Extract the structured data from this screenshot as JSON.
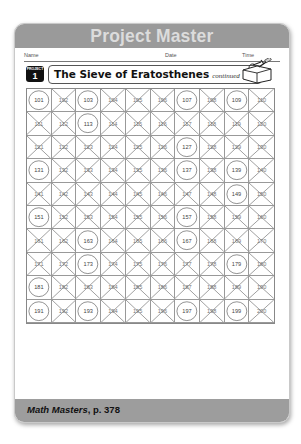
{
  "header": {
    "banner_title": "Project Master"
  },
  "meta_fields": {
    "name_label": "Name",
    "date_label": "Date",
    "time_label": "Time"
  },
  "project_badge": {
    "small_label": "PROJECT",
    "number": "1"
  },
  "title": {
    "main": "The Sieve of Eratosthenes",
    "sub": "continued"
  },
  "icons": {
    "header_icon": "toolbox-icon"
  },
  "grid": {
    "rows": 10,
    "columns": 10,
    "start": 101,
    "end": 200,
    "marking": {
      "prime": "circled",
      "composite": "crossed-out (X)"
    },
    "primes": [
      101,
      103,
      107,
      109,
      113,
      127,
      131,
      137,
      139,
      149,
      151,
      157,
      163,
      167,
      173,
      179,
      181,
      191,
      193,
      197,
      199
    ],
    "cells": [
      "101",
      "102",
      "103",
      "104",
      "105",
      "106",
      "107",
      "108",
      "109",
      "110",
      "111",
      "112",
      "113",
      "114",
      "115",
      "116",
      "117",
      "118",
      "119",
      "120",
      "121",
      "122",
      "123",
      "124",
      "125",
      "126",
      "127",
      "128",
      "129",
      "130",
      "131",
      "132",
      "133",
      "134",
      "135",
      "136",
      "137",
      "138",
      "139",
      "140",
      "141",
      "142",
      "143",
      "144",
      "145",
      "146",
      "147",
      "148",
      "149",
      "150",
      "151",
      "152",
      "153",
      "154",
      "155",
      "156",
      "157",
      "158",
      "159",
      "160",
      "161",
      "162",
      "163",
      "164",
      "165",
      "166",
      "167",
      "168",
      "169",
      "170",
      "171",
      "172",
      "173",
      "174",
      "175",
      "176",
      "177",
      "178",
      "179",
      "180",
      "181",
      "182",
      "183",
      "184",
      "185",
      "186",
      "187",
      "188",
      "189",
      "190",
      "191",
      "192",
      "193",
      "194",
      "195",
      "196",
      "197",
      "198",
      "199",
      "200"
    ]
  },
  "footer": {
    "book_title": "Math Masters",
    "page_ref": ", p. 378"
  },
  "colors": {
    "banner": "#9a9a9a",
    "banner_text": "#dcdcdc",
    "footer": "#9d9d9d",
    "grid_line": "#999999"
  }
}
